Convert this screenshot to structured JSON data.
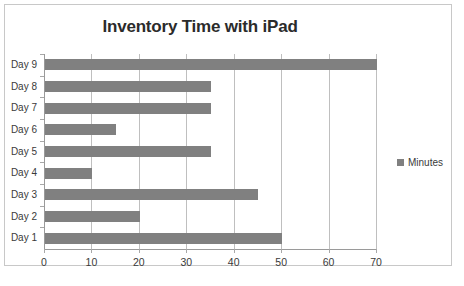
{
  "chart_data": {
    "type": "bar",
    "orientation": "horizontal",
    "title": "Inventory Time with iPad",
    "xlabel": "",
    "ylabel": "",
    "categories": [
      "Day 1",
      "Day 2",
      "Day 3",
      "Day 4",
      "Day 5",
      "Day 6",
      "Day 7",
      "Day 8",
      "Day 9"
    ],
    "values": [
      50,
      20,
      45,
      10,
      35,
      15,
      35,
      35,
      70
    ],
    "series": [
      {
        "name": "Minutes",
        "color": "#808080",
        "values": [
          50,
          20,
          45,
          10,
          35,
          15,
          35,
          35,
          70
        ]
      }
    ],
    "xlim": [
      0,
      70
    ],
    "xticks": [
      0,
      10,
      20,
      30,
      40,
      50,
      60,
      70
    ],
    "xtick_labels": [
      "0",
      "10",
      "20",
      "30",
      "40",
      "50",
      "60",
      "70"
    ],
    "grid": "vertical",
    "legend": {
      "position": "right",
      "entries": [
        {
          "label": "Minutes",
          "color": "#808080",
          "marker": "square-swatch"
        }
      ]
    },
    "colors": {
      "bar": "#808080",
      "gridline": "#bfbfbf",
      "axis": "#9a9a9a",
      "frame_border": "#c8c8c8",
      "title_text": "#2b2b2b",
      "label_text": "#3a3a3a",
      "background": "#ffffff"
    }
  }
}
